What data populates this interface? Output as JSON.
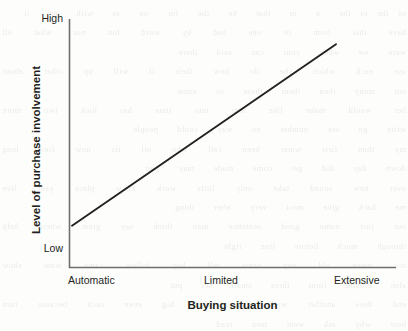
{
  "chart_data": {
    "type": "line",
    "title": "",
    "subtitle": "",
    "xlabel": "Buying situation",
    "ylabel": "Level of purchase involvement",
    "categories": [
      "Automatic",
      "Limited",
      "Extensive"
    ],
    "x": [
      0,
      1,
      2
    ],
    "y": [
      0.12,
      0.52,
      0.92
    ],
    "series": [
      {
        "name": "Purchase involvement",
        "values": [
          0.12,
          0.52,
          0.92
        ]
      }
    ],
    "ytick_labels": [
      "Low",
      "High"
    ],
    "ytick_low": "Low",
    "ytick_high": "High",
    "ylim": [
      0,
      1
    ],
    "xlim": [
      0,
      2
    ],
    "grid": false,
    "legend": false,
    "legend_position": "none",
    "annotations": [],
    "line_color": "#231f20",
    "axis_color": "#6b6b6b",
    "background_color": "#fdfdfc"
  },
  "axes": {
    "y": {
      "label": "Level of purchase involvement",
      "high": "High",
      "low": "Low"
    },
    "x": {
      "label": "Buying situation",
      "ticks": [
        {
          "label": "Automatic"
        },
        {
          "label": "Limited"
        },
        {
          "label": "Extensive"
        }
      ]
    }
  },
  "page_bleed": {
    "text": "of the to the  a  in  that  be  the  for  on  as  with  an  it\nhave  this  from  or  one  had  by  word  but  not  what  all  were  we  when  your  can  said  there\nuse  each  which  she  do  how  their  if  will  up  other  about  out  many  then  them  these  so  some\nher  would  make  like  him  into  time  has  look  two  more  write  go  see  number  no  way  could  people\nmy  than  first  water  been  call  who  oil  its  now  find  long  down  day  did  get  come  made  may  part\nover  new  sound  take  only  little  work  know  place  year  live  me  back  give  most  very  after  thing\nour  just  name  good  sentence  man  think  say  great  where  help  through  much  before  line  right\ntoo  mean  old  any  same  tell  boy  follow  came  want  show  also  around  form  three  small  set  put\nend  does  another  well  large  must  big  even  such  because  turn  here  why  ask  went  men  read\nneed  land  different  home  us  move  try  kind  hand  picture  again  change  off  play  spell  air  away\nanimal  house  point  page  letter  mother  answer  found  study  still  learn  should  America  world\nhigh  every  near  add  food  between  own  below  country  plant  last  school  father  keep  tree\nnever  start  city  earth  eye  light  thought  head  under  story  saw  left  don't  few  while  along\nmight  close  something  seem  next  hard  open  example  begin  life  always  those  both  paper\ntogether  got  group  often  run  important  until  children  side  feet  car  mile  night  walk  white"
  }
}
